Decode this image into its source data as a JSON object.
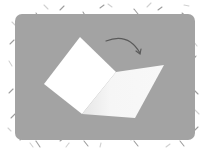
{
  "illustration": {
    "caption": "Folded card opening illustration",
    "background_color": "#a3a3a3",
    "card_color": "#ffffff",
    "card_shade_color": "#f1f1f1",
    "arrow_color": "#5a5a5a",
    "confetti_color": "#8c8c8c",
    "icons": {
      "card": "folded-card-icon",
      "arrow": "curved-arrow-icon"
    }
  }
}
